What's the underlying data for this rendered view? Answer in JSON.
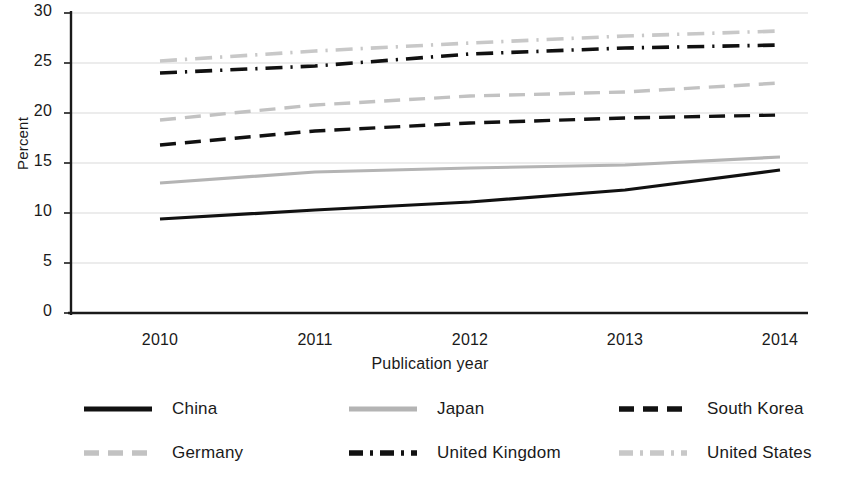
{
  "chart_data": {
    "type": "line",
    "title": "",
    "xlabel": "Publication year",
    "ylabel": "Percent",
    "x": [
      2010,
      2011,
      2012,
      2013,
      2014
    ],
    "xtick_labels": [
      "2010",
      "2011",
      "2012",
      "2013",
      "2014"
    ],
    "ytick_labels": [
      "0",
      "5",
      "10",
      "15",
      "20",
      "25",
      "30"
    ],
    "ytick_values": [
      0,
      5,
      10,
      15,
      20,
      25,
      30
    ],
    "ylim": [
      0,
      30
    ],
    "grid": "horizontal",
    "legend_position": "bottom",
    "series": [
      {
        "name": "China",
        "values": [
          9.4,
          10.3,
          11.1,
          12.3,
          14.3
        ],
        "color": "#111111",
        "style": "solid",
        "linewidth": 3.2
      },
      {
        "name": "Japan",
        "values": [
          13.0,
          14.1,
          14.5,
          14.8,
          15.6
        ],
        "color": "#b4b4b4",
        "style": "solid",
        "linewidth": 3.2
      },
      {
        "name": "South Korea",
        "values": [
          16.8,
          18.2,
          19.0,
          19.5,
          19.8
        ],
        "color": "#111111",
        "style": "dashed",
        "linewidth": 3.4
      },
      {
        "name": "Germany",
        "values": [
          19.3,
          20.8,
          21.7,
          22.1,
          23.0
        ],
        "color": "#c2c2c2",
        "style": "dashed",
        "linewidth": 3.4
      },
      {
        "name": "United Kingdom",
        "values": [
          24.0,
          24.7,
          25.9,
          26.5,
          26.8
        ],
        "color": "#111111",
        "style": "dashdot",
        "linewidth": 3.6
      },
      {
        "name": "United States",
        "values": [
          25.2,
          26.2,
          27.0,
          27.7,
          28.2
        ],
        "color": "#c8c8c8",
        "style": "dashdot",
        "linewidth": 3.6
      }
    ]
  },
  "axis": {
    "y_title": "Percent",
    "x_title": "Publication year"
  },
  "legend": {
    "rows": [
      [
        {
          "label": "China",
          "style": "solid",
          "color": "#111111"
        },
        {
          "label": "Japan",
          "style": "solid",
          "color": "#b4b4b4"
        },
        {
          "label": "South Korea",
          "style": "dashed",
          "color": "#111111"
        }
      ],
      [
        {
          "label": "Germany",
          "style": "dashed",
          "color": "#c2c2c2"
        },
        {
          "label": "United Kingdom",
          "style": "dashdot",
          "color": "#111111"
        },
        {
          "label": "United States",
          "style": "dashdot",
          "color": "#c8c8c8"
        }
      ]
    ]
  }
}
